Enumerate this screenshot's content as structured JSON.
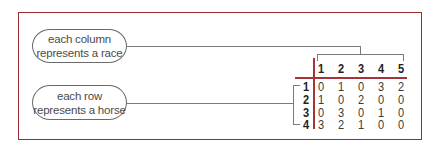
{
  "callouts": {
    "column": {
      "line1": "each column",
      "line2": "represents a race"
    },
    "row": {
      "line1": "each row",
      "line2": "represents a horse"
    }
  },
  "matrix": {
    "column_headers": [
      "1",
      "2",
      "3",
      "4",
      "5"
    ],
    "row_headers": [
      "1",
      "2",
      "3",
      "4"
    ],
    "rows": [
      [
        "0",
        "1",
        "0",
        "3",
        "2"
      ],
      [
        "1",
        "0",
        "2",
        "0",
        "0"
      ],
      [
        "0",
        "3",
        "0",
        "1",
        "0"
      ],
      [
        "3",
        "2",
        "1",
        "0",
        "0"
      ]
    ]
  },
  "colors": {
    "frame": "#9b2b32",
    "matrix_rules": "#a8323a",
    "connectors": "#7a7a7a"
  }
}
